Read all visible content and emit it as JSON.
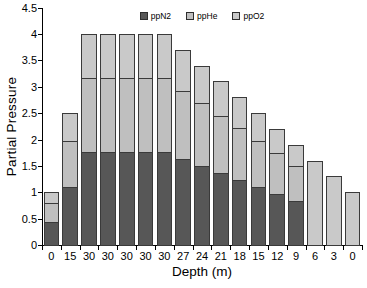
{
  "chart": {
    "legend_labels": [
      "ppN2",
      "ppHe",
      "ppO2"
    ],
    "colors": {
      "ppN2_fill": "#575757",
      "ppHe_fill": "#bfbfbf",
      "ppO2_fill": "#c9c9c9",
      "segment_border": "#3a3a3a",
      "axis": "#000000",
      "background": "#ffffff"
    },
    "y_tick_labels": [
      "0",
      "0.5",
      "1",
      "1.5",
      "2",
      "2.5",
      "3",
      "3.5",
      "4",
      "4.5"
    ],
    "x_tick_labels": [
      "0",
      "15",
      "30",
      "30",
      "30",
      "30",
      "30",
      "27",
      "24",
      "21",
      "18",
      "15",
      "12",
      "9",
      "6",
      "3",
      "0"
    ]
  },
  "chart_data": {
    "type": "bar",
    "stacked": true,
    "title": "",
    "xlabel": "Depth (m)",
    "ylabel": "Partial Pressure",
    "ylim": [
      0,
      4.5
    ],
    "y_tick_step": 0.5,
    "grid": false,
    "legend_position": "top-center",
    "categories": [
      "0",
      "15",
      "30",
      "30",
      "30",
      "30",
      "30",
      "27",
      "24",
      "21",
      "18",
      "15",
      "12",
      "9",
      "6",
      "3",
      "0"
    ],
    "series": [
      {
        "name": "ppN2",
        "color": "#575757",
        "values": [
          0.44,
          1.1,
          1.76,
          1.76,
          1.76,
          1.76,
          1.76,
          1.628,
          1.496,
          1.364,
          1.232,
          1.1,
          0.968,
          0.836,
          0,
          0,
          0
        ]
      },
      {
        "name": "ppHe",
        "color": "#bfbfbf",
        "values": [
          0.35,
          0.875,
          1.4,
          1.4,
          1.4,
          1.4,
          1.4,
          1.295,
          1.19,
          1.085,
          0.98,
          0.875,
          0.77,
          0.665,
          0,
          0,
          0
        ]
      },
      {
        "name": "ppO2",
        "color": "#c9c9c9",
        "values": [
          0.21,
          0.525,
          0.84,
          0.84,
          0.84,
          0.84,
          0.84,
          0.777,
          0.714,
          0.651,
          0.588,
          0.525,
          0.462,
          0.399,
          1.6,
          1.3,
          1.0
        ]
      }
    ],
    "bar_totals": [
      1.0,
      2.5,
      4.0,
      4.0,
      4.0,
      4.0,
      4.0,
      3.7,
      3.4,
      3.1,
      2.8,
      2.5,
      2.2,
      1.9,
      1.6,
      1.3,
      1.0
    ]
  }
}
